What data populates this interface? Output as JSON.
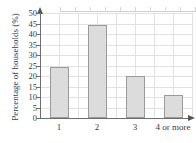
{
  "chart_data": {
    "type": "bar",
    "title": "",
    "xlabel": "",
    "ylabel": "Percentage of households (%)",
    "categories": [
      "1",
      "2",
      "3",
      "4 or more"
    ],
    "values": [
      24.4,
      44.3,
      20.0,
      11.0
    ],
    "ylim": [
      0,
      50
    ],
    "yticks": [
      0,
      5,
      10,
      15,
      20,
      25,
      30,
      35,
      40,
      45,
      50
    ],
    "ytick_labels": [
      "0",
      "5",
      "10",
      "15",
      "20",
      "25",
      "30",
      "35",
      "40",
      "45",
      "50"
    ],
    "grid": true,
    "legend": null,
    "bar_fill_color": "#dcdcdc",
    "bar_edge_color": "#9a9a9a",
    "axis_color": "#6e6e6e",
    "grid_color": "#e2e2e2",
    "y_axis_arrow": true,
    "x_axis_arrow": true
  }
}
